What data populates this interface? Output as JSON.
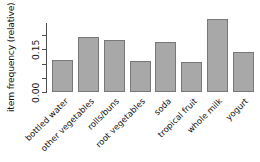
{
  "chart_data": {
    "type": "bar",
    "title": "",
    "subtitle": "",
    "xlabel": "",
    "ylabel": "item frequency (relative)",
    "categories": [
      "bottled water",
      "other vegetables",
      "rolls/buns",
      "root vegetables",
      "soda",
      "tropical fruit",
      "whole milk",
      "yogurt"
    ],
    "values": [
      0.111,
      0.193,
      0.184,
      0.109,
      0.174,
      0.105,
      0.256,
      0.139
    ],
    "series": [
      {
        "name": "item frequency (relative)",
        "values": [
          0.111,
          0.193,
          0.184,
          0.109,
          0.174,
          0.105,
          0.256,
          0.139
        ]
      }
    ],
    "ylim": [
      0.0,
      0.26
    ],
    "xlim": [
      0,
      8
    ],
    "y_ticks": [
      0.0,
      0.05,
      0.1,
      0.15,
      0.2
    ],
    "y_tick_labels": [
      "0.00",
      "",
      "",
      "0.15",
      ""
    ],
    "y_labeled_ticks": [
      {
        "value": 0.0,
        "label": "0.00"
      },
      {
        "value": 0.15,
        "label": "0.15"
      }
    ],
    "grid": false,
    "legend": false,
    "legend_position": "none",
    "bar_color": "#a8a8a8",
    "bar_border_color": "#787878",
    "axis_color": "#4d4d4d",
    "text_color": "#111111",
    "background_color": "#ffffff",
    "x_label_rotation_deg": 45
  }
}
